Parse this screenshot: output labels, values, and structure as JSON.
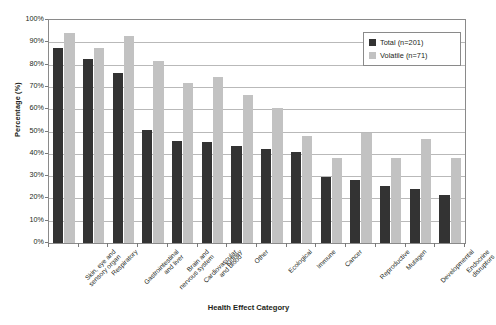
{
  "chart_data": {
    "type": "bar",
    "title": "",
    "xlabel": "Health Effect Category",
    "ylabel": "Percentage (%)",
    "ylim": [
      0,
      100
    ],
    "ytick_labels": [
      "100%",
      "90%",
      "80%",
      "70%",
      "60%",
      "50%",
      "40%",
      "30%",
      "20%",
      "10%",
      "0%"
    ],
    "ytick_values": [
      100,
      90,
      80,
      70,
      60,
      50,
      40,
      30,
      20,
      10,
      0
    ],
    "grid": true,
    "legend_position": "top-right",
    "categories": [
      "Skin, eye and sensory organ",
      "Respiratory",
      "Gastrointestinal and liver",
      "Brain and nervous system",
      "Cardiovascular and blood",
      "Kidney",
      "Other",
      "Ecological",
      "Immune",
      "Cancer",
      "Reproductive",
      "Mutagen",
      "Developmental",
      "Endocrine disruptors"
    ],
    "series": [
      {
        "name": "Total  (n=201)",
        "color": "#333333",
        "values": [
          87.6,
          82.6,
          76.1,
          50.7,
          45.8,
          45.3,
          43.3,
          42.3,
          40.8,
          29.4,
          28.4,
          25.4,
          24.4,
          21.4
        ]
      },
      {
        "name": "Volatile (n=71)",
        "color": "#c2c2c2",
        "values": [
          94.4,
          87.3,
          93.0,
          81.7,
          71.8,
          74.6,
          66.2,
          60.6,
          47.9,
          38.0,
          49.3,
          38.0,
          46.5,
          38.0
        ]
      }
    ]
  },
  "legend": {
    "items": [
      {
        "label": "Total  (n=201)",
        "swatch": "total"
      },
      {
        "label": "Volatile (n=71)",
        "swatch": "volatile"
      }
    ]
  },
  "axes": {
    "x_title": "Health Effect Category",
    "y_title": "Percentage (%)"
  }
}
